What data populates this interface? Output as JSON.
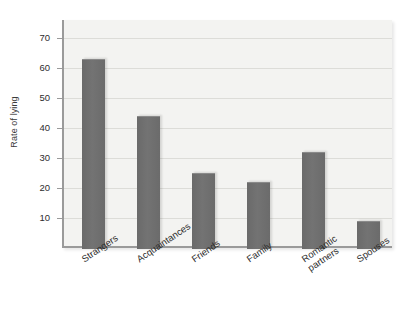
{
  "chart_data": {
    "type": "bar",
    "title": "",
    "xlabel": "",
    "ylabel": "Rate of lying",
    "categories": [
      "Strangers",
      "Acquaintances",
      "Friends",
      "Family",
      "Romantic partners",
      "Spouses"
    ],
    "values": [
      63,
      44,
      25,
      22,
      32,
      9
    ],
    "ylim": [
      0,
      76
    ],
    "yticks": [
      10,
      20,
      30,
      40,
      50,
      60,
      70
    ],
    "ytick_labels": [
      "10",
      "20",
      "30",
      "40",
      "50",
      "60",
      "70"
    ],
    "grid": true,
    "legend": "none",
    "bar_color": "#6e6e6e",
    "plot_background": "#f3f3f1",
    "axis_color": "#9a9a9a",
    "text_color": "#2d2d2d"
  },
  "axis": {
    "y_title": "Rate of lying"
  }
}
